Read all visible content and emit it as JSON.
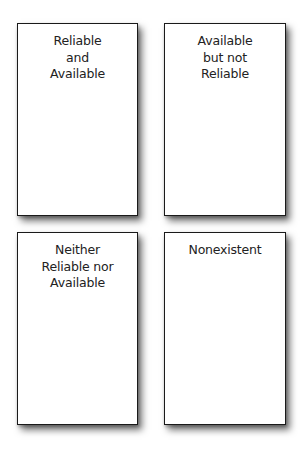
{
  "diagram": {
    "cards": [
      {
        "position": "top-left",
        "label": "Reliable\nand\nAvailable"
      },
      {
        "position": "top-right",
        "label": "Available\nbut not\nReliable"
      },
      {
        "position": "bottom-left",
        "label": "Neither\nReliable nor\nAvailable"
      },
      {
        "position": "bottom-right",
        "label": "Nonexistent"
      }
    ]
  }
}
